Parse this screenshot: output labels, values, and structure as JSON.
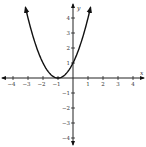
{
  "chart_data": {
    "type": "line",
    "title": "",
    "function": "y = (x + 1)^2",
    "xlabel": "x",
    "ylabel": "y",
    "xlim": [
      -4.7,
      4.7
    ],
    "ylim": [
      -4.5,
      4.7
    ],
    "grid": false,
    "x_ticks": [
      -4,
      -3,
      -2,
      -1,
      1,
      2,
      3,
      4
    ],
    "y_ticks": [
      -4,
      -3,
      -2,
      -1,
      1,
      2,
      3,
      4
    ],
    "x_tick_labels": [
      "−4",
      "−3",
      "−2",
      "−1",
      "1",
      "2",
      "3",
      "4"
    ],
    "y_tick_labels": [
      "−4",
      "−3",
      "−2",
      "−1",
      "1",
      "2",
      "3",
      "4"
    ],
    "series": [
      {
        "name": "parabola",
        "x": [
          -3.17,
          -3,
          -2.5,
          -2,
          -1.5,
          -1,
          -0.5,
          0,
          0.5,
          1,
          1.17
        ],
        "values": [
          4.7,
          4,
          2.25,
          1,
          0.25,
          0,
          0.25,
          1,
          2.25,
          4,
          4.7
        ]
      }
    ],
    "annotations": {
      "vertex": [
        -1,
        0
      ],
      "y_intercept": [
        0,
        1
      ]
    },
    "colors": {
      "axis": "#222222",
      "curve": "#111111",
      "text": "#333333"
    }
  }
}
